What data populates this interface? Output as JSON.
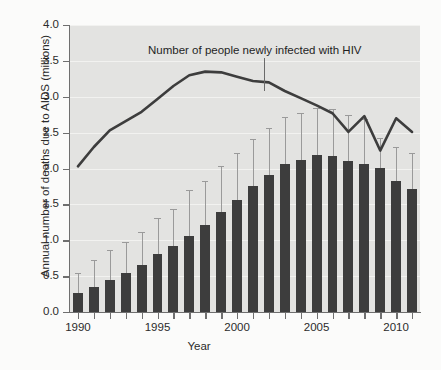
{
  "chart_data": {
    "type": "bar",
    "title": "",
    "xlabel": "Year",
    "ylabel": "Annual number of deaths due to AIDS (millions)",
    "xlim": [
      1989.5,
      2011.5
    ],
    "ylim": [
      0.0,
      4.0
    ],
    "grid": true,
    "legend_position": "none",
    "x_tick_labels": [
      "1990",
      "1995",
      "2000",
      "2005",
      "2010"
    ],
    "x_tick_values": [
      1990,
      1995,
      2000,
      2005,
      2010
    ],
    "y_tick_labels": [
      "0.0",
      "0.5",
      "1.0",
      "1.5",
      "2.0",
      "2.5",
      "3.0",
      "3.5",
      "4.0"
    ],
    "y_tick_values": [
      0.0,
      0.5,
      1.0,
      1.5,
      2.0,
      2.5,
      3.0,
      3.5,
      4.0
    ],
    "categories": [
      1990,
      1991,
      1992,
      1993,
      1994,
      1995,
      1996,
      1997,
      1998,
      1999,
      2000,
      2001,
      2002,
      2003,
      2004,
      2005,
      2006,
      2007,
      2008,
      2009,
      2010,
      2011
    ],
    "series": [
      {
        "name": "Annual number of deaths due to AIDS (millions)",
        "type": "bar",
        "color": "#3d3d3d",
        "values": [
          0.26,
          0.35,
          0.44,
          0.55,
          0.66,
          0.81,
          0.92,
          1.06,
          1.21,
          1.4,
          1.56,
          1.76,
          1.91,
          2.06,
          2.12,
          2.19,
          2.17,
          2.11,
          2.06,
          2.01,
          1.82,
          1.72
        ],
        "error_upper": [
          0.55,
          0.72,
          0.87,
          0.97,
          1.11,
          1.31,
          1.44,
          1.7,
          1.83,
          2.03,
          2.21,
          2.41,
          2.57,
          2.72,
          2.78,
          2.84,
          2.83,
          2.75,
          2.69,
          2.43,
          2.3,
          2.21
        ],
        "error_lower": [
          0.26,
          0.35,
          0.44,
          0.55,
          0.66,
          0.81,
          0.92,
          1.06,
          1.21,
          1.4,
          1.56,
          1.76,
          1.91,
          2.06,
          2.12,
          2.19,
          2.17,
          2.11,
          2.06,
          2.01,
          1.82,
          1.72
        ]
      },
      {
        "name": "Number of people newly infected with HIV",
        "type": "line",
        "color": "#3d3d3d",
        "values": [
          2.03,
          2.3,
          2.53,
          2.66,
          2.79,
          2.97,
          3.15,
          3.3,
          3.35,
          3.34,
          3.28,
          3.22,
          3.2,
          3.08,
          2.98,
          2.88,
          2.77,
          2.51,
          2.73,
          2.25,
          2.7,
          2.51
        ]
      }
    ],
    "annotations": [
      {
        "text": "Number of people newly infected with HIV",
        "points_to_year": 2001,
        "points_to_value": 3.22
      }
    ]
  },
  "axes": {
    "ylabel": "Annual number of deaths due to AIDS (millions)",
    "xlabel": "Year"
  },
  "annotation": {
    "label": "Number of people newly infected with HIV"
  },
  "colors": {
    "bar": "#3d3d3d",
    "line": "#3d3d3d",
    "error_bar": "#9a9a9a",
    "panel_background": "#e3e3e1",
    "figure_background": "#fbfbfa",
    "gridline": "#f2f2f0",
    "axis": "#6f6f6f",
    "text": "#2b2b2b"
  }
}
